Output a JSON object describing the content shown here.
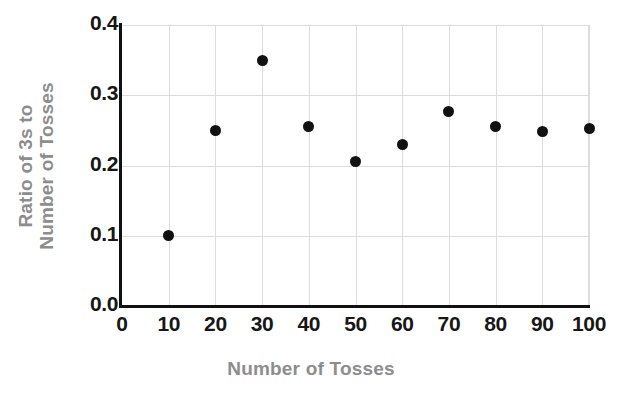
{
  "chart_data": {
    "type": "scatter",
    "title": "",
    "clipped_title_remnant": "Ratio of 3s to Number of Tosses",
    "xlabel": "Number of Tosses",
    "ylabel": "Ratio of 3s to Number of Tosses",
    "ylabel_line1": "Ratio of 3s to",
    "ylabel_line2": "Number of Tosses",
    "xlim": [
      0,
      100
    ],
    "ylim": [
      0.0,
      0.4
    ],
    "xticks": [
      "0",
      "10",
      "20",
      "30",
      "40",
      "50",
      "60",
      "70",
      "80",
      "90",
      "100"
    ],
    "xtick_values": [
      0,
      10,
      20,
      30,
      40,
      50,
      60,
      70,
      80,
      90,
      100
    ],
    "yticks": [
      "0.0",
      "0.1",
      "0.2",
      "0.3",
      "0.4"
    ],
    "ytick_values": [
      0.0,
      0.1,
      0.2,
      0.3,
      0.4
    ],
    "grid": true,
    "legend": "none",
    "series": [
      {
        "name": "Ratio of 3s",
        "marker": "filled-circle",
        "color": "#111111",
        "x": [
          10,
          20,
          30,
          40,
          50,
          60,
          70,
          80,
          90,
          100
        ],
        "values": [
          0.1,
          0.25,
          0.35,
          0.255,
          0.205,
          0.23,
          0.277,
          0.255,
          0.248,
          0.253
        ],
        "points": [
          {
            "x": 10,
            "y": 0.1
          },
          {
            "x": 20,
            "y": 0.25
          },
          {
            "x": 30,
            "y": 0.35
          },
          {
            "x": 40,
            "y": 0.255
          },
          {
            "x": 50,
            "y": 0.205
          },
          {
            "x": 60,
            "y": 0.23
          },
          {
            "x": 70,
            "y": 0.277
          },
          {
            "x": 80,
            "y": 0.255
          },
          {
            "x": 90,
            "y": 0.248
          },
          {
            "x": 100,
            "y": 0.253
          }
        ]
      }
    ],
    "colors": {
      "marker": "#111111",
      "axis": "#111111",
      "grid": "#dcdcdc",
      "tick_label": "#171717",
      "axis_title": "#8d8d8d",
      "background": "#ffffff"
    }
  }
}
